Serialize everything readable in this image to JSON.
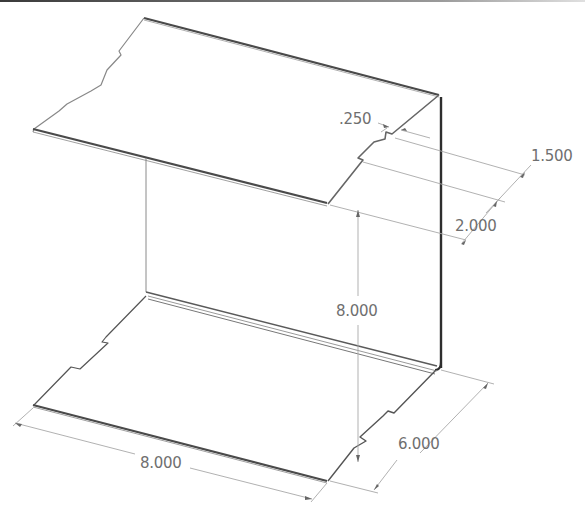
{
  "drawing": {
    "type": "isometric sheet metal part",
    "colors": {
      "edge": "#4a4a4a",
      "edge_light": "#9a9a9a",
      "dimension_line": "#a8a8a8",
      "dimension_text": "#6f6f6f"
    }
  },
  "dimensions": {
    "tab_width": ".250",
    "tab_spacing_1": "1.500",
    "tab_spacing_2": "2.000",
    "height": "8.000",
    "length": "8.000",
    "depth": "6.000"
  }
}
